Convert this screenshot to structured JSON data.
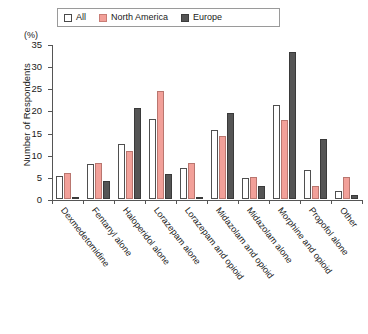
{
  "chart_data": {
    "type": "bar",
    "title": "",
    "subtitle": "",
    "xlabel": "",
    "ylabel": "Number of Respondents",
    "unit_label": "(%)",
    "ylim": [
      0,
      35
    ],
    "yticks": [
      0,
      5,
      10,
      15,
      20,
      25,
      30,
      35
    ],
    "grid": false,
    "legend_position": "top-center",
    "categories": [
      "Dexmedetomidine",
      "Fentanyl alone",
      "Haloperidol alone",
      "Lorazepam alone",
      "Lorazepam and opioid",
      "Midazolam and opioid",
      "Midazolam alone",
      "Morphine and opioid",
      "Propofol alone",
      "Other"
    ],
    "series": [
      {
        "name": "All",
        "color": "#ffffff",
        "values": [
          5.2,
          8.0,
          12.5,
          18.0,
          7.0,
          15.5,
          4.8,
          21.3,
          6.6,
          1.8
        ]
      },
      {
        "name": "North America",
        "color": "#f2a099",
        "values": [
          5.8,
          8.2,
          10.8,
          24.3,
          8.1,
          14.2,
          5.0,
          17.8,
          2.9,
          5.0
        ]
      },
      {
        "name": "Europe",
        "color": "#555555",
        "values": [
          0.3,
          4.0,
          20.5,
          5.7,
          0.5,
          19.5,
          3.0,
          33.3,
          13.6,
          0.8
        ]
      }
    ]
  },
  "legend": {
    "items": [
      {
        "label": "All"
      },
      {
        "label": "North America"
      },
      {
        "label": "Europe"
      }
    ]
  }
}
